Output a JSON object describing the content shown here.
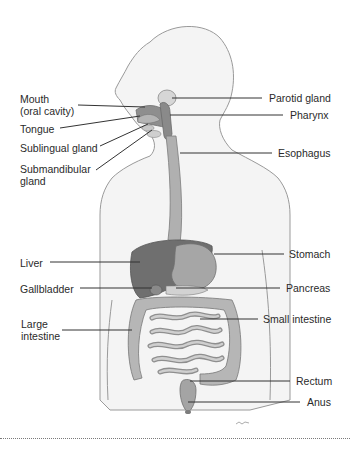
{
  "diagram": {
    "colors": {
      "body_outline": "#9a9a9a",
      "skin_fill": "#f3f3f3",
      "organ_dark": "#7a7a7a",
      "organ_mid": "#a8a8a8",
      "organ_light": "#c8c8c8",
      "leader_line": "#333333"
    },
    "labels_left": [
      {
        "id": "mouth",
        "text_line1": "Mouth",
        "text_line2": "(oral cavity)"
      },
      {
        "id": "tongue",
        "text_line1": "Tongue"
      },
      {
        "id": "sublingual",
        "text_line1": "Sublingual gland"
      },
      {
        "id": "submandibular",
        "text_line1": "Submandibular",
        "text_line2": "gland"
      },
      {
        "id": "liver",
        "text_line1": "Liver"
      },
      {
        "id": "gallbladder",
        "text_line1": "Gallbladder"
      },
      {
        "id": "large_intestine",
        "text_line1": "Large",
        "text_line2": "intestine"
      }
    ],
    "labels_right": [
      {
        "id": "parotid",
        "text_line1": "Parotid gland"
      },
      {
        "id": "pharynx",
        "text_line1": "Pharynx"
      },
      {
        "id": "esophagus",
        "text_line1": "Esophagus"
      },
      {
        "id": "stomach",
        "text_line1": "Stomach"
      },
      {
        "id": "pancreas",
        "text_line1": "Pancreas"
      },
      {
        "id": "small_intestine",
        "text_line1": "Small intestine"
      },
      {
        "id": "rectum",
        "text_line1": "Rectum"
      },
      {
        "id": "anus",
        "text_line1": "Anus"
      }
    ]
  }
}
